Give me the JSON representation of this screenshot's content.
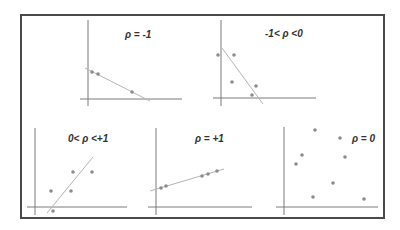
{
  "panels": [
    {
      "id": "rho-neg-one",
      "label": "ρ = -1"
    },
    {
      "id": "rho-neg-partial",
      "label": "-1< ρ <0"
    },
    {
      "id": "rho-pos-partial",
      "label": "0< ρ <+1"
    },
    {
      "id": "rho-pos-one",
      "label": "ρ = +1"
    },
    {
      "id": "rho-zero",
      "label": "ρ = 0"
    }
  ],
  "colors": {
    "frame": "#4a4a4a",
    "axis": "#7a7a7a",
    "fit_line": "#b5b5b5",
    "points": "#8c8c8c"
  }
}
